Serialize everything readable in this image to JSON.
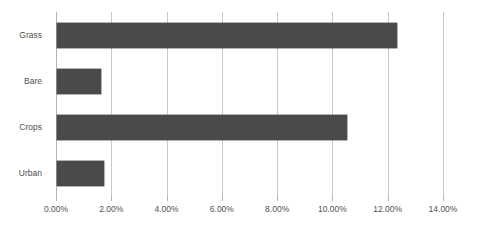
{
  "chart_data": {
    "type": "bar",
    "orientation": "horizontal",
    "title": "",
    "subtitle": "",
    "xlabel": "",
    "ylabel": "",
    "categories": [
      "Grass",
      "Bare",
      "Crops",
      "Urban"
    ],
    "values": [
      12.3,
      1.6,
      10.5,
      1.7
    ],
    "value_labels": [
      "12.30%",
      "1.60%",
      "10.50%",
      "1.70%"
    ],
    "series": [
      {
        "name": "Land cover share",
        "values": [
          12.3,
          1.6,
          10.5,
          1.7
        ],
        "color": "#4a4a4a"
      }
    ],
    "xlim": [
      0,
      14
    ],
    "xticks": [
      0,
      2,
      4,
      6,
      8,
      10,
      12,
      14
    ],
    "xtick_labels": [
      "0.00%",
      "2.00%",
      "4.00%",
      "6.00%",
      "8.00%",
      "10.00%",
      "12.00%",
      "14.00%"
    ],
    "grid": {
      "vertical": true,
      "horizontal": false,
      "color": "#c9c9c9"
    },
    "legend": {
      "visible": false,
      "position": "none",
      "entries": []
    },
    "annotations": [],
    "colors": {
      "bar": "#4a4a4a",
      "grid": "#c9c9c9",
      "axis": "#b4b4b4",
      "text": "#4f4f4f",
      "background": "#ffffff"
    }
  }
}
